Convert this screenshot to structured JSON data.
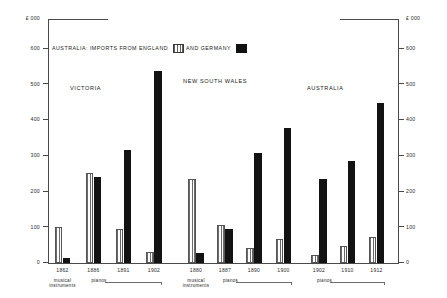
{
  "chart_data": {
    "type": "bar",
    "title": "AUSTRALIA: IMPORTS FROM ENGLAND AND GERMANY",
    "xlabel": "",
    "ylabel": "£ 000",
    "ylim": [
      0,
      700
    ],
    "grid": false,
    "legend_position": "top-left",
    "categories": [
      "1862",
      "1886",
      "1891",
      "1902",
      "1880",
      "1887",
      "1890",
      "1900",
      "1902",
      "1910",
      "1912"
    ],
    "series": [
      {
        "name": "ENGLAND",
        "values": [
          100,
          250,
          95,
          30,
          235,
          105,
          40,
          65,
          20,
          45,
          70
        ]
      },
      {
        "name": "GERMANY",
        "values": [
          12,
          240,
          315,
          535,
          28,
          95,
          305,
          375,
          235,
          285,
          445
        ]
      }
    ],
    "axis": {
      "unit_label_left": "£ 000",
      "unit_label_right": "£ 000",
      "tick_values": [
        600,
        500,
        400,
        300,
        200,
        100,
        0
      ],
      "tick_labels_left": [
        "600",
        "500",
        "400",
        "300",
        "200",
        "100",
        "0"
      ],
      "tick_labels_right": [
        "600",
        "500",
        "400",
        "300",
        "200",
        "100",
        "0"
      ]
    },
    "regions": [
      {
        "label": "VICTORIA",
        "bars": [
          {
            "year": "1862",
            "england": 100,
            "germany": 12,
            "commodity": "musical instruments"
          },
          {
            "year": "1886",
            "england": 250,
            "germany": 240,
            "commodity": "pianos"
          },
          {
            "year": "1891",
            "england": 95,
            "germany": 315,
            "commodity": "pianos"
          },
          {
            "year": "1902",
            "england": 30,
            "germany": 535,
            "commodity": "pianos"
          }
        ],
        "sublabels": [
          {
            "text": "musical instruments",
            "span": [
              "1862"
            ]
          },
          {
            "text": "pianos",
            "span": [
              "1886",
              "1902"
            ]
          }
        ]
      },
      {
        "label": "NEW SOUTH WALES",
        "bars": [
          {
            "year": "1880",
            "england": 235,
            "germany": 28,
            "commodity": "musical instruments"
          },
          {
            "year": "1887",
            "england": 105,
            "germany": 95,
            "commodity": "pianos"
          },
          {
            "year": "1890",
            "england": 40,
            "germany": 305,
            "commodity": "pianos"
          },
          {
            "year": "1900",
            "england": 65,
            "germany": 375,
            "commodity": "pianos"
          }
        ],
        "sublabels": [
          {
            "text": "musical instruments",
            "span": [
              "1880"
            ]
          },
          {
            "text": "pianos",
            "span": [
              "1887",
              "1900"
            ]
          }
        ]
      },
      {
        "label": "AUSTRALIA",
        "bars": [
          {
            "year": "1902",
            "england": 20,
            "germany": 235,
            "commodity": "pianos"
          },
          {
            "year": "1910",
            "england": 45,
            "germany": 285,
            "commodity": "pianos"
          },
          {
            "year": "1912",
            "england": 70,
            "germany": 445,
            "commodity": "pianos"
          }
        ],
        "sublabels": [
          {
            "text": "pianos",
            "span": [
              "1902",
              "1912"
            ]
          }
        ]
      }
    ]
  },
  "legend": {
    "prefix": "AUSTRALIA: IMPORTS FROM ENGLAND",
    "middle": "AND GERMANY",
    "england_label": "ENGLAND",
    "germany_label": "GERMANY"
  },
  "colors": {
    "england": "#6b6b6b",
    "germany": "#131313",
    "axis": "#4a4a4a",
    "background": "#ffffff"
  },
  "labels": {
    "unit_top_left": "£ 000",
    "unit_top_right": "£ 000",
    "y_ticks": [
      "600",
      "500",
      "400",
      "300",
      "200",
      "100",
      "0"
    ],
    "region_titles": [
      "VICTORIA",
      "NEW SOUTH WALES",
      "AUSTRALIA"
    ],
    "x_years": [
      "1862",
      "1886",
      "1891",
      "1902",
      "1880",
      "1887",
      "1890",
      "1900",
      "1902",
      "1910",
      "1912"
    ],
    "sub_musical_1": "musical",
    "sub_musical_2": "instruments",
    "sub_pianos": "pianos"
  }
}
